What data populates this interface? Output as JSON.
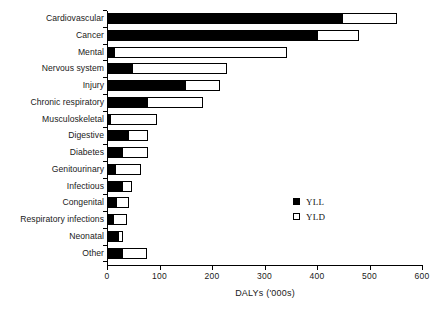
{
  "chart_data": {
    "type": "bar",
    "orientation": "horizontal",
    "stacked": true,
    "title": "",
    "xlabel": "DALYs ('000s)",
    "ylabel": "",
    "xlim": [
      0,
      600
    ],
    "xticks": [
      0,
      100,
      200,
      300,
      400,
      500,
      600
    ],
    "xtick_labels": [
      "0",
      "100",
      "200",
      "300",
      "400",
      "500",
      "600"
    ],
    "grid": false,
    "legend_position": "center-right",
    "categories": [
      "Cardiovascular",
      "Cancer",
      "Mental",
      "Nervous system",
      "Injury",
      "Chronic respiratory",
      "Musculoskeletal",
      "Digestive",
      "Diabetes",
      "Genitourinary",
      "Infectious",
      "Congenital",
      "Respiratory infections",
      "Neonatal",
      "Other"
    ],
    "series": [
      {
        "name": "YLL",
        "color": "#000000",
        "values": [
          450,
          402,
          15,
          50,
          150,
          78,
          7,
          42,
          31,
          18,
          30,
          19,
          14,
          22,
          30
        ]
      },
      {
        "name": "YLD",
        "color": "#ffffff",
        "values": [
          102,
          78,
          328,
          178,
          65,
          105,
          89,
          36,
          47,
          46,
          17,
          23,
          24,
          8,
          46
        ]
      }
    ],
    "totals": [
      552,
      480,
      343,
      228,
      215,
      183,
      96,
      78,
      78,
      64,
      47,
      42,
      38,
      30,
      76
    ]
  },
  "legend": {
    "items": [
      {
        "label": "YLL",
        "marker": "filled-square"
      },
      {
        "label": "YLD",
        "marker": "open-square"
      }
    ]
  },
  "axis": {
    "x_title": "DALYs ('000s)"
  }
}
